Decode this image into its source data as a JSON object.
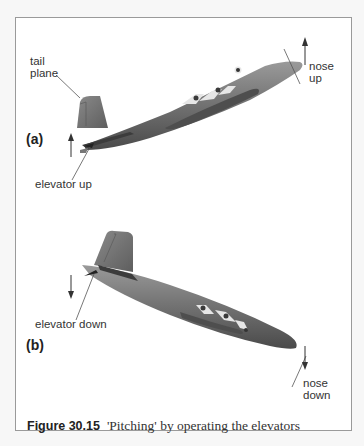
{
  "figure": {
    "number": "Figure 30.15",
    "title": "'Pitching' by operating the elevators"
  },
  "panel_a": {
    "label": "(a)",
    "tail_label_line1": "tail",
    "tail_label_line2": "plane",
    "elevator_label": "elevator up",
    "nose_label_line1": "nose",
    "nose_label_line2": "up"
  },
  "panel_b": {
    "label": "(b)",
    "elevator_label": "elevator down",
    "nose_label_line1": "nose",
    "nose_label_line2": "down"
  },
  "colors": {
    "fuselage": "#6e6e6e",
    "window": "#e8e8e8",
    "frame": "#9a9a9a"
  }
}
